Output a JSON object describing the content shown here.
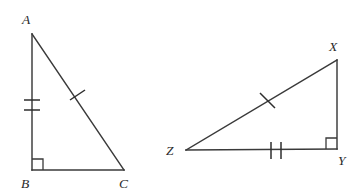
{
  "figure": {
    "background_color": "#ffffff",
    "stroke_color": "#3a3a3a",
    "label_color": "#2a2a2a",
    "width": 360,
    "height": 194
  },
  "triangles": [
    {
      "id": "triangle-abc",
      "name": "Triangle ABC",
      "vertices": [
        {
          "label": "A",
          "x": 32,
          "y": 34,
          "label_x": 22,
          "label_y": 24
        },
        {
          "label": "B",
          "x": 32,
          "y": 170,
          "label_x": 21,
          "label_y": 188
        },
        {
          "label": "C",
          "x": 124,
          "y": 170,
          "label_x": 119,
          "label_y": 188
        }
      ],
      "sides": [
        {
          "name": "AB",
          "from": "A",
          "to": "B",
          "ticks": 2,
          "tick_style": "horizontal"
        },
        {
          "name": "BC",
          "from": "B",
          "to": "C",
          "ticks": 0,
          "tick_style": "none"
        },
        {
          "name": "AC",
          "from": "A",
          "to": "C",
          "ticks": 1,
          "tick_style": "perpendicular"
        }
      ],
      "right_angle_at": "B"
    },
    {
      "id": "triangle-xyz",
      "name": "Triangle XYZ",
      "vertices": [
        {
          "label": "X",
          "x": 337,
          "y": 60,
          "label_x": 329,
          "label_y": 51
        },
        {
          "label": "Y",
          "x": 337,
          "y": 149,
          "label_x": 338,
          "label_y": 165
        },
        {
          "label": "Z",
          "x": 186,
          "y": 150,
          "label_x": 166,
          "label_y": 155
        }
      ],
      "sides": [
        {
          "name": "XY",
          "from": "X",
          "to": "Y",
          "ticks": 0,
          "tick_style": "none"
        },
        {
          "name": "ZY",
          "from": "Z",
          "to": "Y",
          "ticks": 2,
          "tick_style": "vertical"
        },
        {
          "name": "ZX",
          "from": "Z",
          "to": "X",
          "ticks": 1,
          "tick_style": "perpendicular"
        }
      ],
      "right_angle_at": "Y"
    }
  ],
  "labels": {
    "a": "A",
    "b": "B",
    "c": "C",
    "x": "X",
    "y": "Y",
    "z": "Z"
  }
}
